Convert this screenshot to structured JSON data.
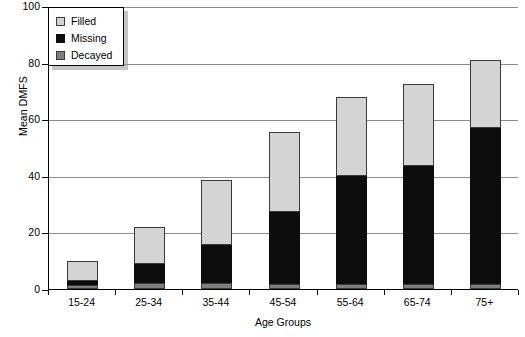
{
  "chart_data": {
    "type": "bar",
    "stacked": true,
    "title": "",
    "xlabel": "Age Groups",
    "ylabel": "Mean DMFS",
    "categories": [
      "15-24",
      "25-34",
      "35-44",
      "45-54",
      "55-64",
      "65-74",
      "75+"
    ],
    "ylim": [
      0,
      100
    ],
    "yticks": [
      0,
      20,
      40,
      60,
      80,
      100
    ],
    "ytick_labels": [
      "0",
      "20",
      "40",
      "60",
      "80",
      "100"
    ],
    "grid": "horizontal",
    "legend_position": "top-left",
    "series": [
      {
        "name": "Decayed",
        "color": "#7e7e7e",
        "values": [
          1.5,
          2.0,
          2.0,
          1.8,
          1.8,
          1.8,
          1.8
        ]
      },
      {
        "name": "Missing",
        "color": "#0d0d0d",
        "values": [
          1.5,
          6.8,
          13.6,
          25.4,
          38.2,
          41.7,
          55.2
        ]
      },
      {
        "name": "Filled",
        "color": "#d4d4d4",
        "values": [
          7.0,
          13.2,
          23.0,
          28.3,
          28.0,
          29.0,
          24.0
        ]
      }
    ],
    "totals": [
      10.0,
      22.0,
      38.6,
      55.5,
      68.0,
      72.5,
      81.0
    ]
  },
  "legend": {
    "items": [
      {
        "label": "Filled",
        "icon": "filled-swatch-icon"
      },
      {
        "label": "Missing",
        "icon": "missing-swatch-icon"
      },
      {
        "label": "Decayed",
        "icon": "decayed-swatch-icon"
      }
    ]
  }
}
